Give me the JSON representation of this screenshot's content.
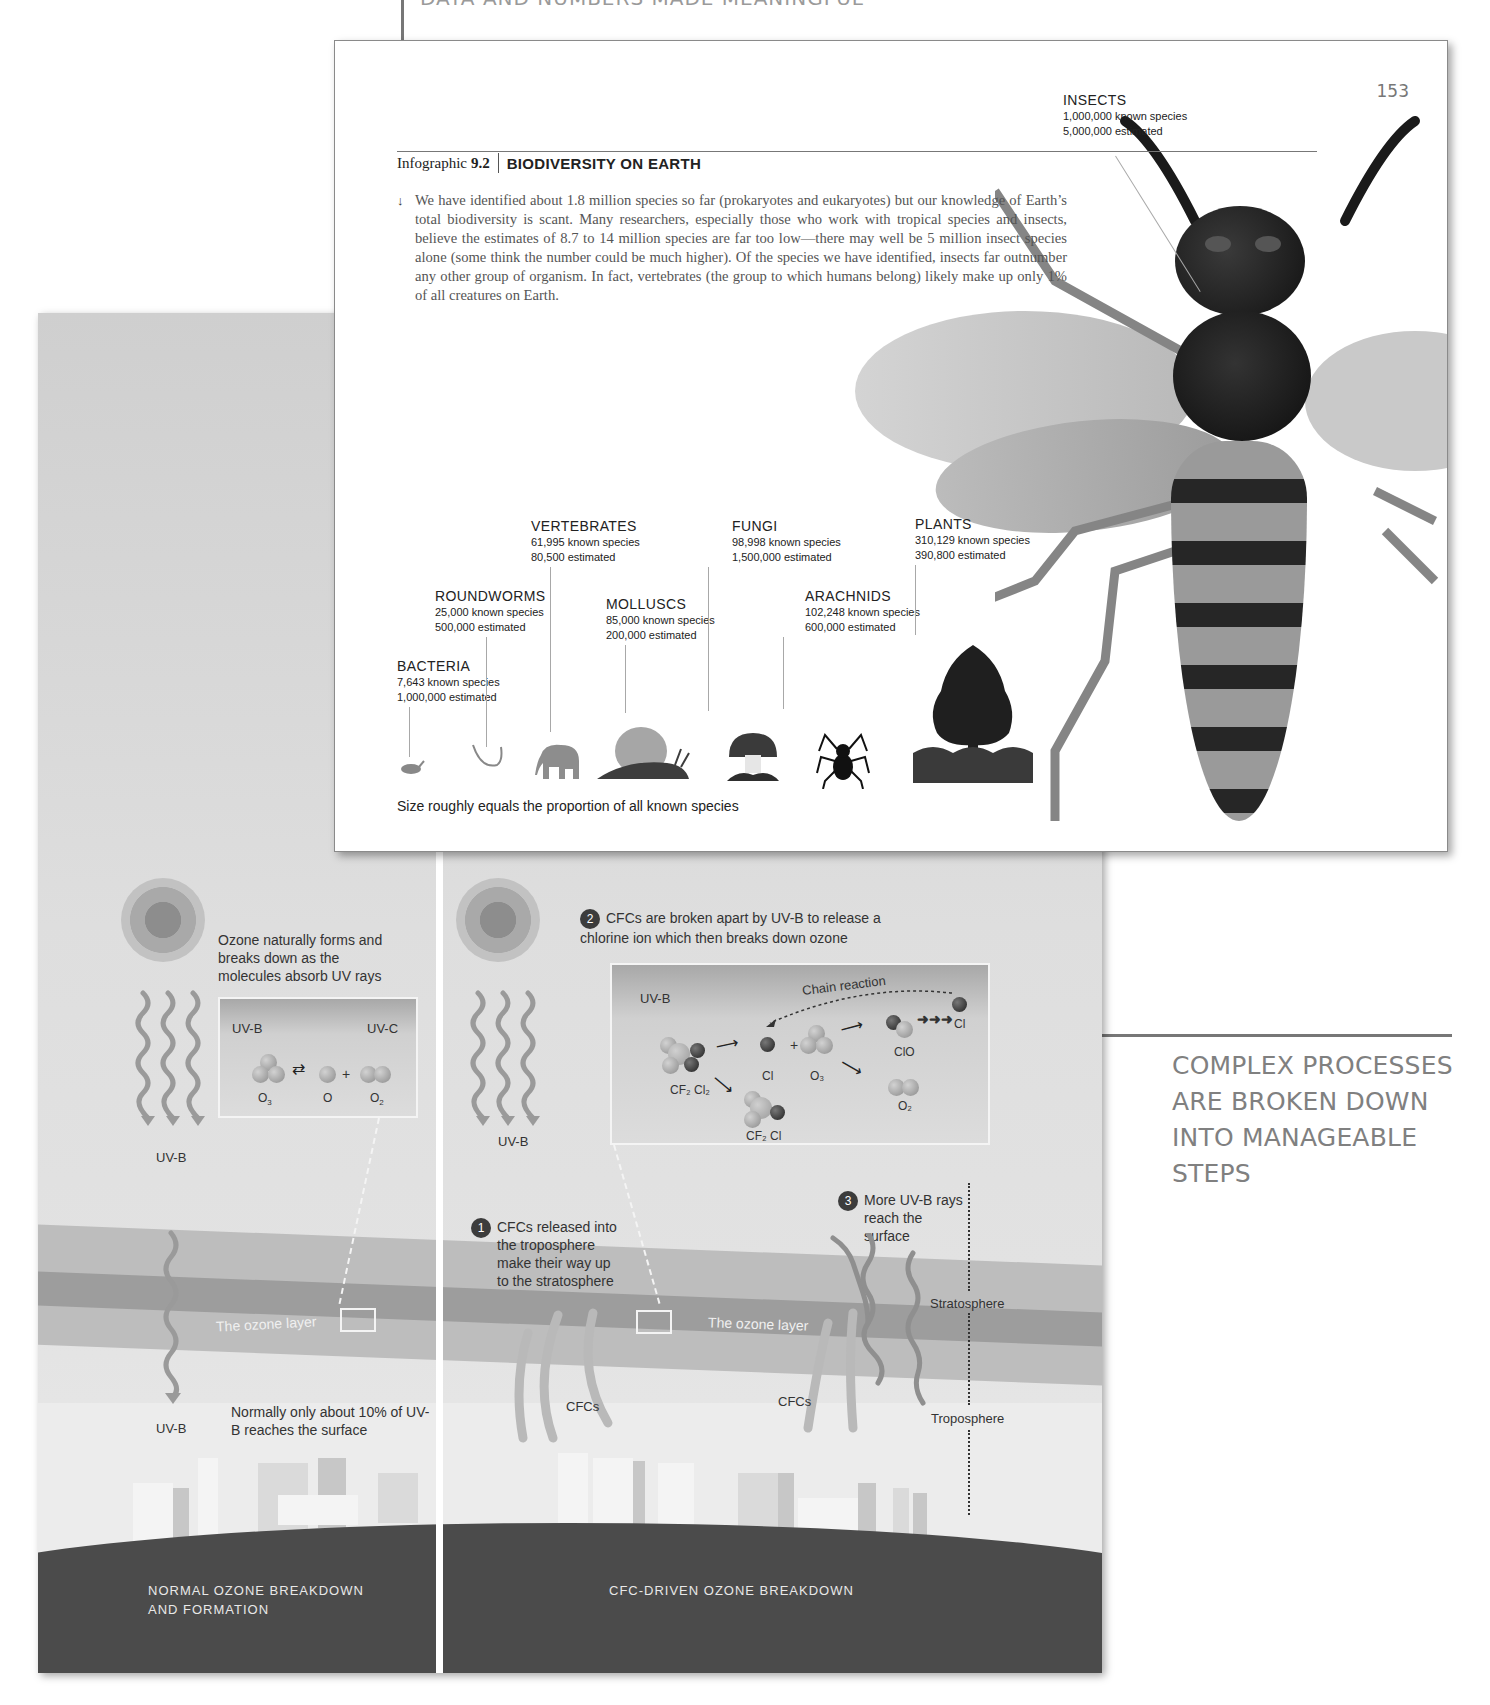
{
  "callouts": {
    "top": {
      "text": "DATA AND NUMBERS MADE MEANINGFUL"
    },
    "right": {
      "lines": [
        "COMPLEX PROCESSES",
        "ARE BROKEN DOWN",
        "INTO MANAGEABLE",
        "STEPS"
      ]
    }
  },
  "biodiversity_page": {
    "page_number": "153",
    "infographic_label": "Infographic",
    "infographic_number": "9.2",
    "title": "BIODIVERSITY ON EARTH",
    "intro_arrow": "↓",
    "intro": "We have identified about 1.8 million species so far (prokaryotes and eukaryotes) but our knowledge of Earth’s total biodiversity is scant. Many researchers, especially those who work with tropical species and insects, believe the estimates of 8.7 to 14 million species are far too low—there may well be 5 million insect species alone (some think the number could be much higher). Of the species we have identified, insects far outnumber any other group of organism. In fact, vertebrates (the group to which humans belong) likely make up only 1% of all creatures on Earth.",
    "groups": [
      {
        "name": "INSECTS",
        "known": "1,000,000 known species",
        "estimated": "5,000,000 estimated",
        "icon": "insect-icon"
      },
      {
        "name": "VERTEBRATES",
        "known": "61,995 known species",
        "estimated": "80,500 estimated",
        "icon": "elephant-icon"
      },
      {
        "name": "FUNGI",
        "known": "98,998 known species",
        "estimated": "1,500,000 estimated",
        "icon": "mushroom-icon"
      },
      {
        "name": "PLANTS",
        "known": "310,129 known species",
        "estimated": "390,800 estimated",
        "icon": "tree-icon"
      },
      {
        "name": "ROUNDWORMS",
        "known": "25,000 known species",
        "estimated": "500,000 estimated",
        "icon": "worm-icon"
      },
      {
        "name": "MOLLUSCS",
        "known": "85,000 known species",
        "estimated": "200,000 estimated",
        "icon": "snail-icon"
      },
      {
        "name": "ARACHNIDS",
        "known": "102,248 known species",
        "estimated": "600,000 estimated",
        "icon": "spider-icon"
      },
      {
        "name": "BACTERIA",
        "known": "7,643 known species",
        "estimated": "1,000,000 estimated",
        "icon": "bacteria-icon"
      }
    ],
    "caption": "Size roughly equals the proportion of all known species"
  },
  "ozone_page": {
    "left": {
      "intro": "Ozone naturally forms and breaks down as the molecules absorb UV rays",
      "reaction": {
        "uvb": "UV-B",
        "uvc": "UV-C",
        "o3": "O",
        "o3_sub": "3",
        "o": "O",
        "o2": "O",
        "o2_sub": "2",
        "plus": "+",
        "equilibrium": "⇄"
      },
      "uvb_label_1": "UV-B",
      "uvb_label_2": "UV-B",
      "surface_note": "Normally only about 10% of UV-B reaches the surface",
      "ozone_layer": "The ozone layer",
      "section_title_line1": "NORMAL OZONE BREAKDOWN",
      "section_title_line2": "AND FORMATION"
    },
    "right": {
      "uvb_label": "UV-B",
      "step1": {
        "num": "1",
        "text": "CFCs released into the troposphere make their way up to the stratosphere"
      },
      "step2": {
        "num": "2",
        "text": "CFCs are broken apart by UV-B to release a chlorine ion which then breaks down ozone"
      },
      "step3": {
        "num": "3",
        "text": "More UV-B rays reach the surface"
      },
      "reaction": {
        "uvb": "UV-B",
        "chain": "Chain reaction",
        "cf2cl2": "CF₂ Cl₂",
        "cf2cl": "CF₂ Cl",
        "cl": "Cl",
        "cl_end": "Cl",
        "o3": "O₃",
        "clo": "ClO",
        "o2": "O₂",
        "plus": "+"
      },
      "ozone_layer": "The ozone layer",
      "cfcs_1": "CFCs",
      "cfcs_2": "CFCs",
      "stratosphere": "Stratosphere",
      "troposphere": "Troposphere",
      "section_title": "CFC-DRIVEN OZONE BREAKDOWN"
    }
  }
}
